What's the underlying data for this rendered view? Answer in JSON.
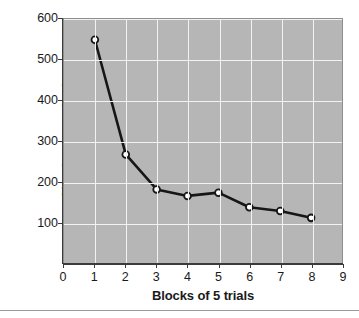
{
  "chart_data": {
    "type": "line",
    "title": "",
    "xlabel": "Blocks of 5 trials",
    "ylabel": "Absolute error (ms)",
    "x": [
      1,
      2,
      3,
      4,
      5,
      6,
      7,
      8
    ],
    "values": [
      549,
      267,
      181,
      165,
      173,
      137,
      128,
      111
    ],
    "series": [
      {
        "name": "Absolute error",
        "x": [
          1,
          2,
          3,
          4,
          5,
          6,
          7,
          8
        ],
        "values": [
          549,
          267,
          181,
          165,
          173,
          137,
          128,
          111
        ]
      }
    ],
    "xlim": [
      0,
      9
    ],
    "ylim": [
      0,
      600
    ],
    "xticks": [
      0,
      1,
      2,
      3,
      4,
      5,
      6,
      7,
      8,
      9
    ],
    "yticks": [
      100,
      200,
      300,
      400,
      500,
      600
    ],
    "xtick_labels": [
      "0",
      "1",
      "2",
      "3",
      "4",
      "5",
      "6",
      "7",
      "8",
      "9"
    ],
    "ytick_labels": [
      "100",
      "200",
      "300",
      "400",
      "500",
      "600"
    ],
    "grid": true,
    "legend": false,
    "marker": "open-circle",
    "colors": {
      "plot_background": "#b6b6b6",
      "gridline": "#f2f2f2",
      "line": "#161616",
      "marker_fill": "#ffffff",
      "marker_stroke": "#161616",
      "axis": "#3b3b3b",
      "text": "#1a1a1a"
    }
  }
}
